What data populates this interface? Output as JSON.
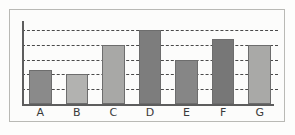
{
  "chart_data": {
    "type": "bar",
    "title": "",
    "subtitle": "",
    "xlabel": "",
    "ylabel": "",
    "categories": [
      "A",
      "B",
      "C",
      "D",
      "E",
      "F",
      "G"
    ],
    "values": [
      2.3,
      2.0,
      4.0,
      5.0,
      3.0,
      4.4,
      4.0
    ],
    "bar_colors": [
      "#8a8a8a",
      "#b2b2b0",
      "#a8a8a6",
      "#7d7d7d",
      "#868686",
      "#777777",
      "#a9a9a7"
    ],
    "bar_edge_color": "#6d6d6d",
    "ylim": [
      0,
      5.6
    ],
    "yticks": [
      1,
      2,
      3,
      4,
      5
    ],
    "ytick_labels": [
      "",
      "",
      "",
      "",
      ""
    ],
    "grid": true,
    "grid_style": "dashed",
    "grid_color": "#4a4a4a",
    "grid_axis": "y",
    "legend": false,
    "legend_position": "none",
    "axis_color": "#5d5d5d",
    "background_color": "#fcfcfb",
    "frame_border_color": "#b9b9b5"
  }
}
